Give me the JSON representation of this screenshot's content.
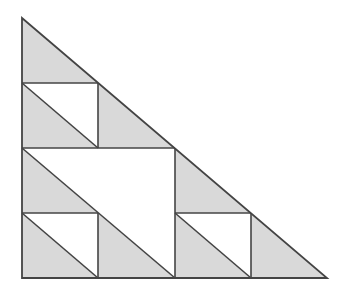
{
  "figure": {
    "colors": {
      "fill": "#d9d9d9",
      "stroke": "#444444",
      "background": "#ffffff"
    },
    "outer_triangle": [
      [
        22,
        18
      ],
      [
        22,
        278
      ],
      [
        327,
        278
      ]
    ],
    "shaded_triangles": [
      [
        [
          22,
          18
        ],
        [
          22,
          83
        ],
        [
          98,
          83
        ]
      ],
      [
        [
          22,
          83
        ],
        [
          22,
          148
        ],
        [
          98,
          148
        ]
      ],
      [
        [
          98,
          83
        ],
        [
          98,
          148
        ],
        [
          175,
          148
        ]
      ],
      [
        [
          22,
          148
        ],
        [
          22,
          213
        ],
        [
          98,
          213
        ]
      ],
      [
        [
          175,
          148
        ],
        [
          175,
          213
        ],
        [
          251,
          213
        ]
      ],
      [
        [
          22,
          213
        ],
        [
          22,
          278
        ],
        [
          98,
          278
        ]
      ],
      [
        [
          98,
          213
        ],
        [
          98,
          278
        ],
        [
          175,
          278
        ]
      ],
      [
        [
          175,
          213
        ],
        [
          175,
          278
        ],
        [
          251,
          278
        ]
      ],
      [
        [
          251,
          213
        ],
        [
          251,
          278
        ],
        [
          327,
          278
        ]
      ]
    ],
    "lines": [
      [
        [
          22,
          83
        ],
        [
          98,
          83
        ]
      ],
      [
        [
          98,
          83
        ],
        [
          98,
          148
        ]
      ],
      [
        [
          22,
          83
        ],
        [
          98,
          148
        ]
      ],
      [
        [
          22,
          148
        ],
        [
          175,
          148
        ]
      ],
      [
        [
          175,
          148
        ],
        [
          175,
          278
        ]
      ],
      [
        [
          22,
          148
        ],
        [
          175,
          278
        ]
      ],
      [
        [
          22,
          213
        ],
        [
          98,
          213
        ]
      ],
      [
        [
          98,
          213
        ],
        [
          98,
          278
        ]
      ],
      [
        [
          22,
          213
        ],
        [
          98,
          278
        ]
      ],
      [
        [
          175,
          213
        ],
        [
          251,
          213
        ]
      ],
      [
        [
          251,
          213
        ],
        [
          251,
          278
        ]
      ],
      [
        [
          175,
          213
        ],
        [
          251,
          278
        ]
      ]
    ]
  }
}
